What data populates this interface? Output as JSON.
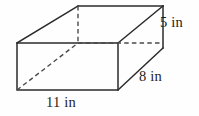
{
  "figure": {
    "shape_name": "rectangular-prism",
    "units": "in",
    "stroke_color": "#2b2b2b",
    "hidden_stroke_color": "#4a4a4a",
    "background_color": "#fefefe"
  },
  "labels": {
    "height": "5 in",
    "depth": "8 in",
    "width": "11 in"
  },
  "dimensions": {
    "height_value": 5,
    "depth_value": 8,
    "width_value": 11
  },
  "geometry": {
    "front_top_left": [
      17,
      43
    ],
    "front_top_right": [
      118,
      43
    ],
    "front_bottom_left": [
      17,
      90
    ],
    "front_bottom_right": [
      118,
      90
    ],
    "back_top_left": [
      78,
      6
    ],
    "back_top_right": [
      163,
      6
    ],
    "back_bottom_left": [
      78,
      43
    ],
    "back_bottom_right": [
      163,
      48
    ]
  }
}
